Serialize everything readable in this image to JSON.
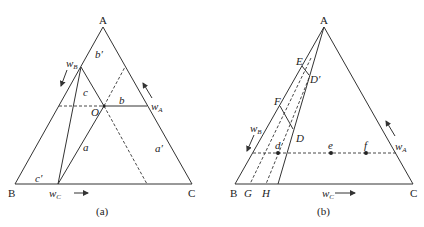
{
  "figure_a": {
    "caption": "(a)",
    "vertices": {
      "A": "A",
      "B": "B",
      "C": "C"
    },
    "point_O": "O",
    "segments": {
      "a": "a",
      "b": "b",
      "c": "c",
      "a_prime": "a′",
      "b_prime": "b′",
      "c_prime": "c′"
    },
    "axes": {
      "wA": "w",
      "wA_sub": "A",
      "wB": "w",
      "wB_sub": "B",
      "wC": "w",
      "wC_sub": "C"
    }
  },
  "figure_b": {
    "caption": "(b)",
    "vertices": {
      "A": "A",
      "B": "B",
      "C": "C"
    },
    "points": {
      "D": "D",
      "D_prime": "D′",
      "E": "E",
      "F": "F",
      "G": "G",
      "H": "H",
      "d": "d",
      "e": "e",
      "f": "f"
    },
    "axes": {
      "wA": "w",
      "wA_sub": "A",
      "wB": "w",
      "wB_sub": "B",
      "wC": "w",
      "wC_sub": "C"
    }
  }
}
